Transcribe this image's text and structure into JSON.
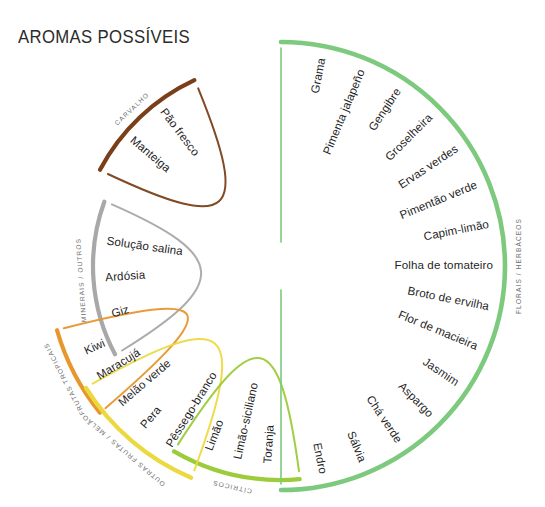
{
  "title": "AROMAS POSSÍVEIS",
  "chart_data": {
    "type": "pie",
    "title": "AROMAS POSSÍVEIS",
    "legend_position": "outer-arc-labels",
    "grid": false,
    "categories": [
      {
        "name": "CARVALHO",
        "color": "#7a3f18",
        "items": [
          "Manteiga",
          "Pão fresco"
        ]
      },
      {
        "name": "MINERAIS / OUTROS",
        "color": "#a8a8a8",
        "items": [
          "Giz",
          "Ardósia",
          "Solução salina"
        ]
      },
      {
        "name": "FRUTAS TROPICAIS",
        "color": "#e8962e",
        "items": [
          "Maracujá",
          "Kiwi"
        ]
      },
      {
        "name": "OUTRAS FRUTAS / MELÃO",
        "color": "#ecd93f",
        "items": [
          "Pêssego-branco",
          "Pera",
          "Melão verde"
        ]
      },
      {
        "name": "CÍTRICOS",
        "color": "#9ccb3b",
        "items": [
          "Toranja",
          "Limão-siciliano",
          "Limão"
        ]
      },
      {
        "name": "FLORAIS / HERBÁCEOS",
        "color": "#7dc97d",
        "items": [
          "Grama",
          "Pimenta jalapeño",
          "Gengibre",
          "Groselheira",
          "Ervas verdes",
          "Pimentão verde",
          "Capim-limão",
          "Folha de tomateiro",
          "Broto de ervilha",
          "Flor de macieira",
          "Jasmim",
          "Aspargo",
          "Chá verde",
          "Sálvia",
          "Endro"
        ]
      }
    ]
  }
}
